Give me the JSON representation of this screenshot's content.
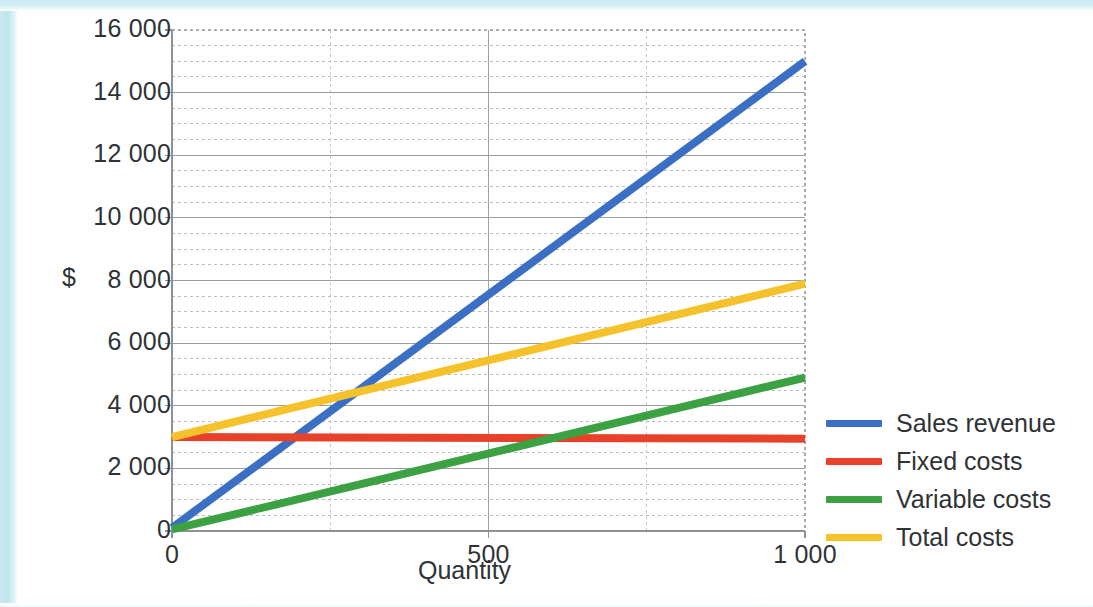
{
  "chart_data": {
    "type": "line",
    "title": "",
    "xlabel": "Quantity",
    "ylabel": "$",
    "xlim": [
      0,
      1000
    ],
    "ylim": [
      0,
      16000
    ],
    "grid": true,
    "legend_position": "right",
    "x_ticks": [
      "0",
      "500",
      "1 000"
    ],
    "x_tick_values": [
      0,
      500,
      1000
    ],
    "y_ticks": [
      "0",
      "2 000",
      "4 000",
      "6 000",
      "8 000",
      "10 000",
      "12 000",
      "14 000",
      "16 000"
    ],
    "y_tick_values": [
      0,
      2000,
      4000,
      6000,
      8000,
      10000,
      12000,
      14000,
      16000
    ],
    "y_major_step": 2000,
    "y_minor_step": 500,
    "x_minor_step": 250,
    "x": [
      0,
      1000
    ],
    "series": [
      {
        "name": "Sales revenue",
        "color": "#3a6fc4",
        "values": [
          100,
          15000
        ]
      },
      {
        "name": "Fixed costs",
        "color": "#e8412a",
        "values": [
          3000,
          2950
        ]
      },
      {
        "name": "Variable costs",
        "color": "#3ba143",
        "values": [
          50,
          4900
        ]
      },
      {
        "name": "Total costs",
        "color": "#f5c22c",
        "values": [
          3000,
          7900
        ]
      }
    ],
    "annotations": []
  },
  "legend": {
    "items": [
      {
        "label": "Sales revenue",
        "color": "#3a6fc4"
      },
      {
        "label": "Fixed costs",
        "color": "#e8412a"
      },
      {
        "label": "Variable costs",
        "color": "#3ba143"
      },
      {
        "label": "Total costs",
        "color": "#f5c22c"
      }
    ]
  },
  "axes": {
    "y_title": "$",
    "x_title": "Quantity"
  }
}
